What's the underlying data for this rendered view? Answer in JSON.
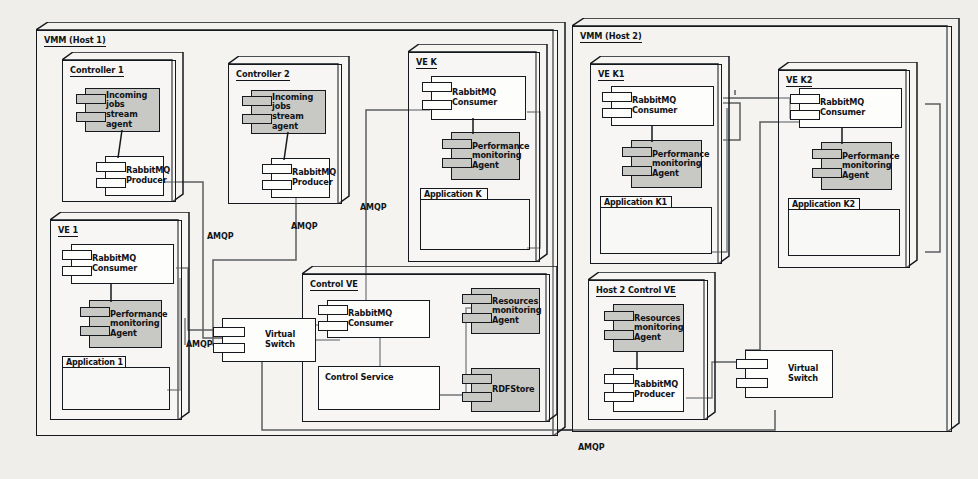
{
  "diagram": {
    "colors": {
      "background": "#efeeea",
      "stroke": "#15181c",
      "agent_fill": "#c8c8c4",
      "component_fill": "#fdfdfb"
    }
  },
  "hosts": [
    {
      "id": "host1",
      "label": "VMM (Host 1)"
    },
    {
      "id": "host2",
      "label": "VMM (Host 2)"
    }
  ],
  "nodes": [
    {
      "id": "controller1",
      "label": "Controller 1"
    },
    {
      "id": "controller2",
      "label": "Controller 2"
    },
    {
      "id": "vek",
      "label": "VE K"
    },
    {
      "id": "ve1",
      "label": "VE 1"
    },
    {
      "id": "controlve",
      "label": "Control VE"
    },
    {
      "id": "vek1",
      "label": "VE K1"
    },
    {
      "id": "vek2",
      "label": "VE K2"
    },
    {
      "id": "host2control",
      "label": "Host 2 Control VE"
    }
  ],
  "components": {
    "incoming_jobs_agent": "Incoming jobs stream agent",
    "rabbitmq_producer": "RabbitMQ Producer",
    "rabbitmq_consumer": "RabbitMQ Consumer",
    "performance_agent": "Performance monitoring Agent",
    "resources_agent": "Resources monitoring Agent",
    "rdfstore": "RDFStore",
    "control_service": "Control Service",
    "virtual_switch": "Virtual Switch"
  },
  "packages": {
    "application_1": "Application 1",
    "application_k": "Application K",
    "application_k1": "Application K1",
    "application_k2": "Application K2"
  },
  "edge_labels": {
    "amqp": "AMQP"
  },
  "edges": [
    {
      "from": "controller1.rabbitmq_producer",
      "to": "host1.virtual_switch",
      "protocol": "AMQP"
    },
    {
      "from": "controller2.rabbitmq_producer",
      "to": "host1.virtual_switch",
      "protocol": "AMQP"
    },
    {
      "from": "ve1.rabbitmq_consumer",
      "to": "host1.virtual_switch",
      "protocol": "AMQP"
    },
    {
      "from": "vek.rabbitmq_consumer",
      "to": "host1.virtual_switch",
      "protocol": "AMQP"
    },
    {
      "from": "controlve.rabbitmq_consumer",
      "to": "host1.virtual_switch",
      "protocol": "AMQP"
    },
    {
      "from": "vek1.rabbitmq_consumer",
      "to": "host2.virtual_switch",
      "protocol": "AMQP"
    },
    {
      "from": "vek2.rabbitmq_consumer",
      "to": "host2.virtual_switch",
      "protocol": "AMQP"
    },
    {
      "from": "host2control.rabbitmq_producer",
      "to": "host2.virtual_switch",
      "protocol": "AMQP"
    },
    {
      "from": "host2.virtual_switch",
      "to": "host1.virtual_switch",
      "protocol": "AMQP"
    }
  ]
}
